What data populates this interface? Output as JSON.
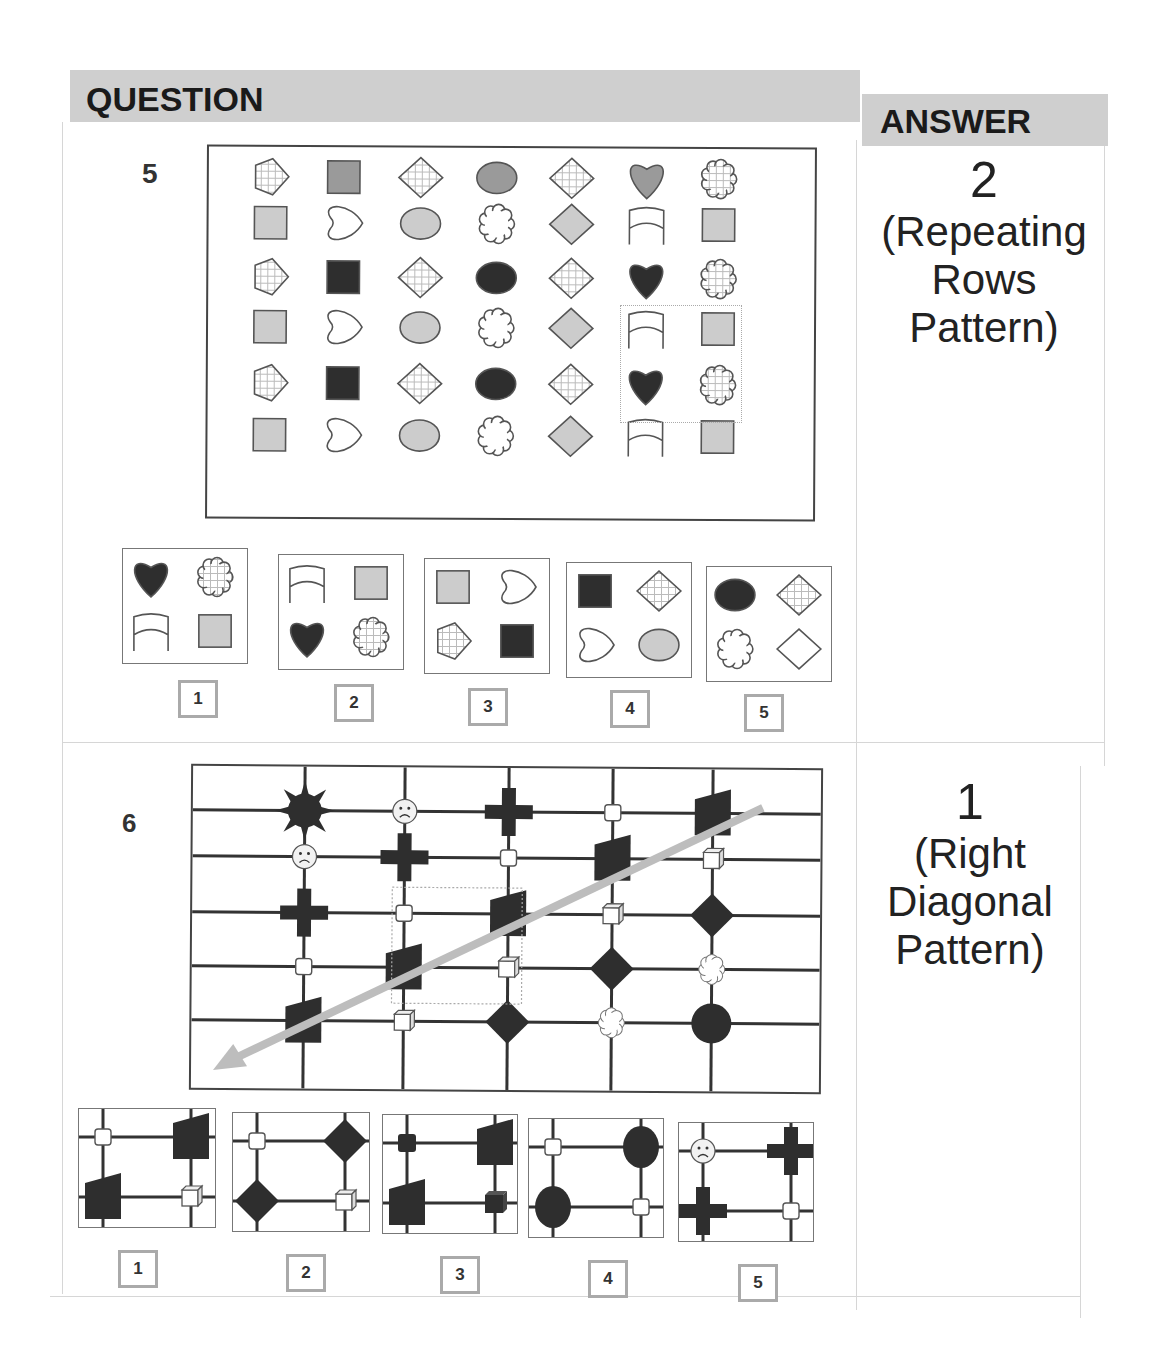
{
  "header": {
    "question_label": "QUESTION",
    "answer_label": "ANSWER"
  },
  "questions": [
    {
      "number": "5",
      "answer_value": "2",
      "answer_explanation_lines": [
        "(Repeating",
        "Rows",
        "Pattern)"
      ],
      "pattern": "Repeating Rows Pattern",
      "grid_rows": [
        [
          "hatched-pentagon",
          "gray-square",
          "hatched-diamond",
          "gray-oval",
          "hatched-diamond",
          "gray-heart",
          "hatched-cloud"
        ],
        [
          "light-square",
          "outline-heart",
          "light-oval",
          "outline-cloud",
          "light-diamond",
          "outline-arch",
          "light-square"
        ],
        [
          "hatched-pentagon",
          "black-square",
          "hatched-diamond",
          "black-oval",
          "hatched-diamond",
          "black-heart",
          "hatched-cloud"
        ],
        [
          "light-square",
          "outline-heart",
          "light-oval",
          "outline-cloud",
          "light-diamond",
          "outline-arch",
          "light-square"
        ],
        [
          "hatched-pentagon",
          "black-square",
          "hatched-diamond",
          "black-oval",
          "hatched-diamond",
          "black-heart",
          "hatched-cloud"
        ],
        [
          "light-square",
          "outline-heart",
          "light-oval",
          "outline-cloud",
          "light-diamond",
          "outline-arch",
          "light-square"
        ]
      ],
      "options": [
        {
          "label": "1",
          "cells": [
            "black-heart",
            "hatched-cloud",
            "outline-arch",
            "light-square"
          ]
        },
        {
          "label": "2",
          "cells": [
            "outline-arch",
            "light-square",
            "black-heart",
            "hatched-cloud"
          ]
        },
        {
          "label": "3",
          "cells": [
            "light-square",
            "outline-heart",
            "hatched-pentagon",
            "black-square"
          ]
        },
        {
          "label": "4",
          "cells": [
            "black-square",
            "hatched-diamond",
            "outline-heart",
            "light-oval"
          ]
        },
        {
          "label": "5",
          "cells": [
            "black-oval",
            "hatched-diamond",
            "outline-cloud",
            "outline-diamond"
          ]
        }
      ]
    },
    {
      "number": "6",
      "answer_value": "1",
      "answer_explanation_lines": [
        "(Right",
        "Diagonal",
        "Pattern)"
      ],
      "pattern": "Right Diagonal Pattern",
      "grid_rows": [
        [
          "sun",
          "sad-face",
          "cross",
          "small-square",
          "trapezoid"
        ],
        [
          "sad-face",
          "cross",
          "small-square",
          "trapezoid",
          "cube"
        ],
        [
          "cross",
          "small-square",
          "trapezoid",
          "cube",
          "diamond"
        ],
        [
          "small-square",
          "trapezoid",
          "cube",
          "diamond",
          "cloud"
        ],
        [
          "trapezoid",
          "cube",
          "diamond",
          "cloud",
          "circle"
        ]
      ],
      "options": [
        {
          "label": "1",
          "cells": [
            "small-square",
            "trapezoid",
            "trapezoid",
            "cube"
          ]
        },
        {
          "label": "2",
          "cells": [
            "small-square",
            "diamond",
            "diamond",
            "cube"
          ]
        },
        {
          "label": "3",
          "cells": [
            "small-black-square",
            "trapezoid",
            "trapezoid",
            "black-cube"
          ]
        },
        {
          "label": "4",
          "cells": [
            "small-square",
            "black-oval",
            "black-oval",
            "small-square"
          ]
        },
        {
          "label": "5",
          "cells": [
            "sad-face",
            "cross",
            "cross",
            "small-square"
          ]
        }
      ]
    }
  ],
  "colors": {
    "header_bg": "#cfcfcf",
    "dark_fill": "#2e2e2e",
    "gray_fill": "#9a9a9a",
    "light_fill": "#cccccc",
    "arrow": "#bdbdbd"
  }
}
